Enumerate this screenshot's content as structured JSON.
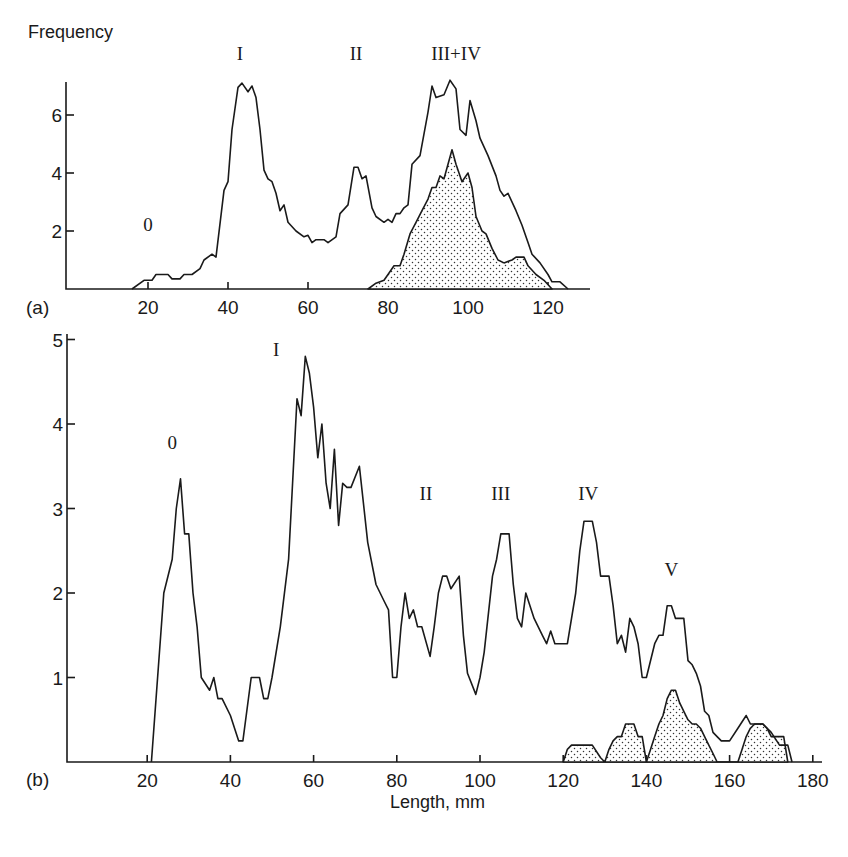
{
  "chart_data": [
    {
      "panel": "(a)",
      "type": "line",
      "title": "",
      "ylabel": "Frequency",
      "xlabel": "",
      "xlim": [
        0,
        130
      ],
      "ylim": [
        0,
        7.3
      ],
      "xticks": [
        20,
        40,
        60,
        80,
        100,
        120
      ],
      "yticks": [
        2,
        4,
        6
      ],
      "grid": false,
      "peak_labels": [
        {
          "text": "0",
          "x": 20,
          "y": 2.0
        },
        {
          "text": "I",
          "x": 43,
          "y": 7.9
        },
        {
          "text": "II",
          "x": 72,
          "y": 7.9
        },
        {
          "text": "III+IV",
          "x": 97,
          "y": 7.9
        }
      ],
      "series": [
        {
          "name": "all fish",
          "style": "outline",
          "x": [
            16,
            19,
            21,
            22,
            25,
            26,
            28,
            29,
            31,
            33,
            34,
            36,
            37,
            39,
            40,
            41,
            42.5,
            43.5,
            45,
            46,
            47,
            48,
            49,
            50,
            51,
            52,
            53,
            54,
            55,
            57,
            59,
            60,
            61,
            62,
            64,
            65,
            67,
            68,
            70,
            71.5,
            72.5,
            73.5,
            74.5,
            76,
            77,
            79,
            80,
            81,
            82,
            83,
            84,
            85,
            86,
            88,
            90,
            91,
            92,
            94,
            95.5,
            97,
            98,
            99.5,
            100.5,
            102,
            103,
            105,
            107,
            108,
            109,
            110,
            112,
            113.5,
            115,
            116,
            118,
            120,
            121,
            123,
            125
          ],
          "y": [
            0,
            0.3,
            0.3,
            0.5,
            0.5,
            0.35,
            0.35,
            0.5,
            0.5,
            0.7,
            1.0,
            1.2,
            1.1,
            3.4,
            3.7,
            5.5,
            6.95,
            7.1,
            6.8,
            7.0,
            6.6,
            5.5,
            4.1,
            3.8,
            3.7,
            3.3,
            2.7,
            2.9,
            2.3,
            2.0,
            1.8,
            1.85,
            1.6,
            1.7,
            1.7,
            1.6,
            1.8,
            2.6,
            2.9,
            4.2,
            4.2,
            3.8,
            3.9,
            2.8,
            2.5,
            2.3,
            2.4,
            2.3,
            2.6,
            2.6,
            2.8,
            2.9,
            4.3,
            4.6,
            6.1,
            7.0,
            6.6,
            6.7,
            7.2,
            6.9,
            5.5,
            5.3,
            6.5,
            5.8,
            5.2,
            4.6,
            3.9,
            3.4,
            3.2,
            3.3,
            2.7,
            2.2,
            1.6,
            1.2,
            0.9,
            0.5,
            0.25,
            0.25,
            0
          ]
        },
        {
          "name": "subset (stippled)",
          "style": "stippled",
          "x": [
            75,
            77,
            79,
            80,
            81.5,
            83,
            84,
            85.5,
            87,
            88.5,
            90,
            91,
            92,
            93,
            94,
            96,
            97,
            98.5,
            100,
            101,
            102,
            103.5,
            104.5,
            106,
            107.5,
            109,
            111,
            112,
            114,
            115,
            117,
            119,
            121
          ],
          "y": [
            0,
            0.2,
            0.3,
            0.5,
            0.8,
            0.8,
            1.2,
            1.9,
            2.3,
            2.7,
            3.1,
            3.5,
            3.5,
            3.9,
            3.8,
            4.8,
            4.3,
            3.7,
            4.0,
            3.5,
            2.5,
            2.0,
            1.9,
            1.4,
            1.0,
            0.9,
            1.0,
            1.1,
            1.1,
            0.8,
            0.5,
            0.3,
            0
          ]
        }
      ]
    },
    {
      "panel": "(b)",
      "type": "line",
      "title": "",
      "ylabel": "",
      "xlabel": "Length, mm",
      "xlim": [
        0,
        182
      ],
      "ylim": [
        0,
        5
      ],
      "xticks": [
        20,
        40,
        60,
        80,
        100,
        120,
        140,
        160,
        180
      ],
      "yticks": [
        1,
        2,
        3,
        4,
        5
      ],
      "grid": false,
      "peak_labels": [
        {
          "text": "0",
          "x": 26,
          "y": 3.7
        },
        {
          "text": "I",
          "x": 51,
          "y": 4.8
        },
        {
          "text": "II",
          "x": 87,
          "y": 3.1
        },
        {
          "text": "III",
          "x": 105,
          "y": 3.1
        },
        {
          "text": "IV",
          "x": 126,
          "y": 3.1
        },
        {
          "text": "V",
          "x": 146,
          "y": 2.2
        }
      ],
      "series": [
        {
          "name": "all fish",
          "style": "outline",
          "x": [
            21,
            24,
            26,
            27,
            28,
            29,
            30,
            31,
            32,
            33,
            35,
            36,
            37,
            38,
            40,
            42,
            43,
            45,
            47,
            48,
            49,
            50,
            52,
            54,
            56,
            57,
            58,
            59,
            60,
            61,
            62,
            63,
            64,
            65,
            66,
            67,
            68,
            69,
            71,
            73,
            75,
            77,
            78,
            79,
            80,
            81,
            82,
            83,
            84,
            85,
            86,
            88,
            89,
            90,
            91,
            92,
            93,
            95,
            96,
            97,
            99,
            100,
            101,
            103,
            104,
            105,
            106,
            107,
            108,
            109,
            110,
            111,
            113,
            115,
            116,
            117,
            118,
            119,
            121,
            123,
            124,
            125,
            126,
            127,
            128,
            129,
            130,
            131,
            132,
            133,
            134,
            135,
            136,
            137,
            138,
            139,
            140,
            142,
            143,
            144,
            145,
            146,
            147,
            148,
            149,
            150,
            151,
            152,
            153,
            154,
            155,
            156,
            157,
            158,
            159,
            160,
            162,
            164,
            165,
            166,
            168,
            170,
            172,
            174,
            175
          ],
          "y": [
            0,
            2.0,
            2.4,
            3.0,
            3.35,
            2.7,
            2.7,
            2.0,
            1.6,
            1.0,
            0.85,
            1.0,
            0.75,
            0.75,
            0.55,
            0.25,
            0.25,
            1.0,
            1.0,
            0.75,
            0.75,
            1.0,
            1.6,
            2.4,
            4.3,
            4.1,
            4.8,
            4.6,
            4.2,
            3.6,
            4.0,
            3.3,
            3.0,
            3.7,
            2.8,
            3.3,
            3.25,
            3.25,
            3.5,
            2.6,
            2.1,
            1.9,
            1.8,
            1.0,
            1.0,
            1.6,
            2.0,
            1.7,
            1.8,
            1.6,
            1.6,
            1.25,
            1.6,
            2.0,
            2.2,
            2.2,
            2.05,
            2.2,
            1.5,
            1.05,
            0.8,
            1.0,
            1.3,
            2.2,
            2.4,
            2.7,
            2.7,
            2.7,
            2.1,
            1.7,
            1.6,
            2.0,
            1.7,
            1.5,
            1.4,
            1.55,
            1.4,
            1.4,
            1.4,
            2.0,
            2.5,
            2.85,
            2.85,
            2.85,
            2.6,
            2.2,
            2.2,
            2.2,
            1.85,
            1.4,
            1.5,
            1.3,
            1.7,
            1.6,
            1.4,
            1.0,
            1.0,
            1.4,
            1.5,
            1.5,
            1.85,
            1.85,
            1.7,
            1.7,
            1.7,
            1.2,
            1.15,
            1.05,
            0.9,
            0.6,
            0.55,
            0.35,
            0.3,
            0.25,
            0.25,
            0.25,
            0.4,
            0.55,
            0.45,
            0.45,
            0.45,
            0.35,
            0.2,
            0.2,
            0
          ]
        },
        {
          "name": "subset (stippled)",
          "style": "stippled",
          "x": [
            120,
            121,
            122,
            124,
            126,
            127,
            129,
            130,
            131,
            132,
            133,
            134,
            135,
            136,
            137,
            138,
            139,
            140,
            141,
            142,
            143,
            144,
            145,
            146,
            147,
            148,
            149,
            150,
            151,
            152,
            153,
            154,
            155,
            156,
            157,
            162,
            163,
            164,
            165,
            166,
            167,
            168,
            169,
            170,
            171,
            172,
            173,
            174
          ],
          "y": [
            0,
            0.15,
            0.2,
            0.2,
            0.2,
            0.2,
            0.05,
            0,
            0.15,
            0.25,
            0.3,
            0.3,
            0.45,
            0.45,
            0.45,
            0.3,
            0.3,
            0,
            0.15,
            0.3,
            0.45,
            0.55,
            0.75,
            0.85,
            0.85,
            0.7,
            0.6,
            0.5,
            0.45,
            0.45,
            0.4,
            0.3,
            0.2,
            0.1,
            0,
            0,
            0.15,
            0.3,
            0.4,
            0.45,
            0.45,
            0.45,
            0.4,
            0.3,
            0.3,
            0.3,
            0.3,
            0
          ]
        }
      ]
    }
  ],
  "labels": {
    "panel_a": "(a)",
    "panel_b": "(b)",
    "y_axis_title": "Frequency",
    "x_axis_title": "Length, mm"
  }
}
